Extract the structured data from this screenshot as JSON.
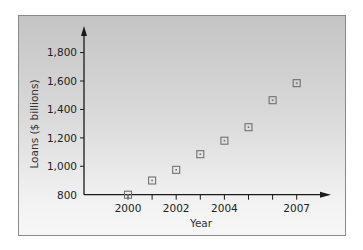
{
  "chart_data": {
    "type": "scatter",
    "title": "",
    "xlabel": "Year",
    "ylabel": "Loans ($ billions)",
    "x": [
      2000,
      2001,
      2002,
      2003,
      2004,
      2005,
      2006,
      2007
    ],
    "series": [
      {
        "name": "Loans",
        "values": [
          800,
          900,
          975,
          1085,
          1180,
          1275,
          1465,
          1585
        ]
      }
    ],
    "x_tick_labels": [
      "2000",
      "2002",
      "2004",
      "2007"
    ],
    "x_tick_label_years": [
      2000,
      2002,
      2004,
      2007
    ],
    "y_ticks": [
      800,
      1000,
      1200,
      1400,
      1600,
      1800
    ],
    "y_tick_labels": [
      "800",
      "1,000",
      "1,200",
      "1,400",
      "1,600",
      "1,800"
    ],
    "ylim": [
      800,
      1800
    ],
    "xlim": [
      2000,
      2007
    ],
    "grid": false,
    "legend": null,
    "marker": "square-with-dot"
  },
  "colors": {
    "axis": "#1a1a1a",
    "marker_stroke": "#707070",
    "marker_fill": "none",
    "text": "#222222"
  }
}
